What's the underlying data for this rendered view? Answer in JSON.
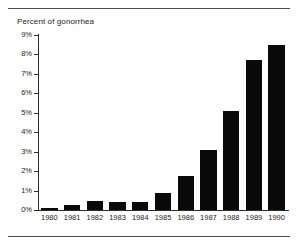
{
  "figure": {
    "title": "Percent of gonorrhea",
    "rules": {
      "top": "horizontal-rule",
      "bottom": "horizontal-rule"
    }
  },
  "chart_data": {
    "type": "bar",
    "title": "Percent of gonorrhea",
    "xlabel": "",
    "ylabel": "Percent of gonorrhea",
    "categories": [
      "1980",
      "1981",
      "1982",
      "1983",
      "1984",
      "1985",
      "1986",
      "1987",
      "1988",
      "1989",
      "1990"
    ],
    "values": [
      0.1,
      0.25,
      0.45,
      0.4,
      0.4,
      0.9,
      1.75,
      3.1,
      5.1,
      7.7,
      8.5
    ],
    "ylim": [
      0,
      9
    ],
    "ytick_values": [
      0,
      1,
      2,
      3,
      4,
      5,
      6,
      7,
      8,
      9
    ],
    "ytick_labels": [
      "0%",
      "1%",
      "2%",
      "3%",
      "4%",
      "5%",
      "6%",
      "7%",
      "8%",
      "9%"
    ],
    "grid": false,
    "legend": null,
    "bar_color": "#0a0a0a",
    "axis_color": "#2e2e2e"
  }
}
